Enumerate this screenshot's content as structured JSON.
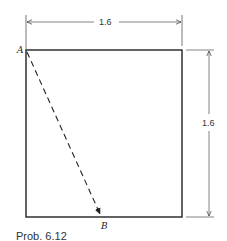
{
  "diagram": {
    "square": {
      "left": 26,
      "top": 50,
      "right": 182,
      "bottom": 217,
      "stroke": "#222222"
    },
    "points": [
      {
        "id": "A",
        "label": "A",
        "x": 26,
        "y": 50
      },
      {
        "id": "B",
        "label": "B",
        "x": 101,
        "y": 216
      }
    ],
    "dashed_arrow": {
      "from": "A",
      "to": "B"
    },
    "dimensions": {
      "width": {
        "label": "1.6"
      },
      "height": {
        "label": "1.6"
      }
    },
    "caption": "Prob. 6.12"
  }
}
